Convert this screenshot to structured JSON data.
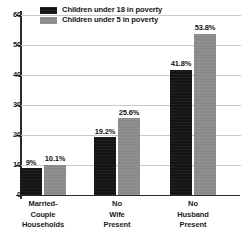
{
  "chart_data": {
    "type": "bar",
    "title": "",
    "subtitle": "",
    "xlabel": "",
    "ylabel": "",
    "ylim": [
      0,
      60
    ],
    "yticks": [
      0,
      10,
      20,
      30,
      40,
      50,
      60
    ],
    "ytick_labels": [
      "0",
      "10",
      "20",
      "30",
      "40",
      "50",
      "60"
    ],
    "grid": true,
    "grid_axis": "y",
    "legend_position": "top-left",
    "categories": [
      "Married-Couple Households",
      "No Wife Present",
      "No Husband Present"
    ],
    "category_lines": [
      [
        "Married-",
        "Couple",
        "Households"
      ],
      [
        "No",
        "Wife",
        "Present"
      ],
      [
        "No",
        "Husband",
        "Present"
      ]
    ],
    "series": [
      {
        "name": "Children under 18 in poverty",
        "color": "#141414",
        "values": [
          9,
          19.2,
          41.8
        ],
        "data_labels": [
          "9%",
          "19.2%",
          "41.8%"
        ]
      },
      {
        "name": "Children under 5 in poverty",
        "color": "#8a8a8a",
        "values": [
          10.1,
          25.6,
          53.8
        ],
        "data_labels": [
          "10.1%",
          "25.6%",
          "53.8%"
        ]
      }
    ]
  },
  "legend": {
    "items": [
      {
        "label": "Children under 18 in poverty",
        "swatch": "dark"
      },
      {
        "label": "Children under 5 in poverty",
        "swatch": "light"
      }
    ]
  },
  "colors": {
    "series_dark": "#141414",
    "series_light": "#8a8a8a",
    "axis": "#2b2b2b",
    "gridline": "#c9c9c9",
    "text": "#161616",
    "background": "#ffffff"
  }
}
